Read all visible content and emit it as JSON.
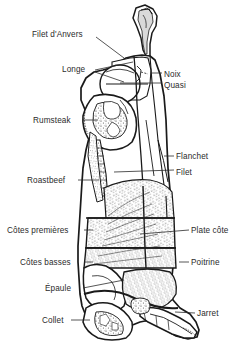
{
  "figure": {
    "language": "fr",
    "background_color": "#ffffff",
    "ink_color": "#1a1a1a",
    "text_color": "#2b2b2b",
    "width": 239,
    "height": 356
  },
  "labels": [
    {
      "id": "filet-danvers",
      "text": "Filet d'Anvers",
      "side": "left",
      "x": 32,
      "y": 30,
      "leader": {
        "x1": 96,
        "y1": 37,
        "x2": 124,
        "y2": 58
      }
    },
    {
      "id": "longe",
      "text": "Longe",
      "side": "left",
      "x": 62,
      "y": 65,
      "leader": {
        "x1": 95,
        "y1": 70,
        "x2": 133,
        "y2": 62
      }
    },
    {
      "id": "longe2",
      "text": "",
      "side": "left",
      "x": 0,
      "y": 0,
      "leader": {
        "x1": 95,
        "y1": 72,
        "x2": 124,
        "y2": 82
      }
    },
    {
      "id": "noix",
      "text": "Noix",
      "side": "right",
      "x": 164,
      "y": 70,
      "leader": {
        "x1": 152,
        "y1": 73,
        "x2": 162,
        "y2": 73
      }
    },
    {
      "id": "quasi",
      "text": "Quasi",
      "side": "right",
      "x": 164,
      "y": 81,
      "leader": {
        "x1": 120,
        "y1": 83,
        "x2": 162,
        "y2": 83
      }
    },
    {
      "id": "rumsteak",
      "text": "Rumsteak",
      "side": "left",
      "x": 33,
      "y": 116,
      "leader": {
        "x1": 82,
        "y1": 120,
        "x2": 98,
        "y2": 120
      }
    },
    {
      "id": "flanchet",
      "text": "Flanchet",
      "side": "right",
      "x": 176,
      "y": 152,
      "leader": {
        "x1": 164,
        "y1": 156,
        "x2": 174,
        "y2": 156
      }
    },
    {
      "id": "filet",
      "text": "Filet",
      "side": "right",
      "x": 176,
      "y": 168,
      "leader": {
        "x1": 114,
        "y1": 172,
        "x2": 174,
        "y2": 170
      }
    },
    {
      "id": "roastbeef",
      "text": "Roastbeef",
      "side": "left",
      "x": 27,
      "y": 176,
      "leader": {
        "x1": 78,
        "y1": 180,
        "x2": 99,
        "y2": 180
      }
    },
    {
      "id": "cotes-premieres",
      "text": "Côtes premières",
      "side": "left",
      "x": 7,
      "y": 226,
      "leader": {
        "x1": 84,
        "y1": 230,
        "x2": 93,
        "y2": 230
      }
    },
    {
      "id": "plate-cote",
      "text": "Plate côte",
      "side": "right",
      "x": 191,
      "y": 226,
      "leader": {
        "x1": 140,
        "y1": 234,
        "x2": 189,
        "y2": 230
      }
    },
    {
      "id": "cotes-basses",
      "text": "Côtes basses",
      "side": "left",
      "x": 20,
      "y": 258,
      "leader": {
        "x1": 84,
        "y1": 262,
        "x2": 93,
        "y2": 262
      }
    },
    {
      "id": "poitrine",
      "text": "Poitrine",
      "side": "right",
      "x": 191,
      "y": 258,
      "leader": {
        "x1": 179,
        "y1": 262,
        "x2": 189,
        "y2": 262
      }
    },
    {
      "id": "epaule",
      "text": "Épaule",
      "side": "left",
      "x": 45,
      "y": 284,
      "leader": {
        "x1": 83,
        "y1": 288,
        "x2": 124,
        "y2": 280
      }
    },
    {
      "id": "jarret",
      "text": "Jarret",
      "side": "right",
      "x": 197,
      "y": 309,
      "leader": {
        "x1": 175,
        "y1": 312,
        "x2": 195,
        "y2": 313
      }
    },
    {
      "id": "collet",
      "text": "Collet",
      "side": "left",
      "x": 42,
      "y": 316,
      "leader": {
        "x1": 71,
        "y1": 320,
        "x2": 90,
        "y2": 320
      }
    }
  ],
  "cuts_list": [
    "Filet d'Anvers",
    "Longe",
    "Noix",
    "Quasi",
    "Rumsteak",
    "Flanchet",
    "Filet",
    "Roastbeef",
    "Côtes premières",
    "Plate côte",
    "Côtes basses",
    "Poitrine",
    "Épaule",
    "Jarret",
    "Collet"
  ]
}
